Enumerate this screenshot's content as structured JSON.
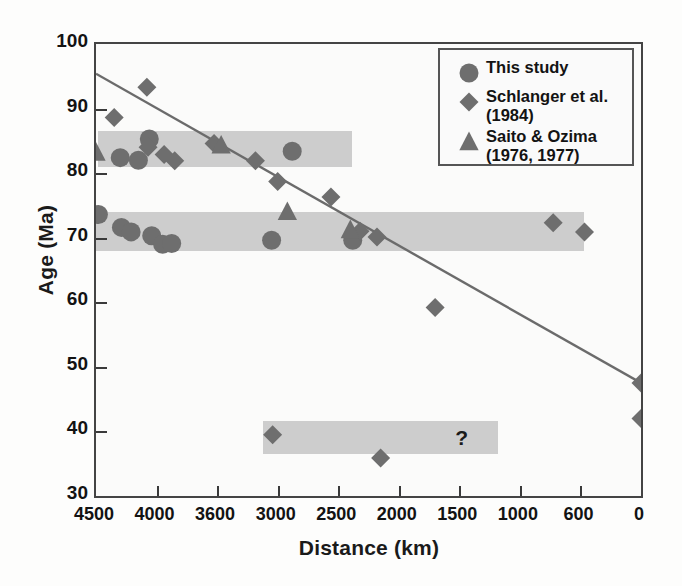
{
  "chart_data": {
    "type": "scatter",
    "title": "",
    "xlabel": "Distance (km)",
    "ylabel": "Age (Ma)",
    "grid": false,
    "legend_position": "top-right",
    "ylim": [
      30,
      100
    ],
    "yticks": [
      100,
      90,
      80,
      70,
      60,
      50,
      40,
      30
    ],
    "xticks_labels": [
      "4500",
      "4000",
      "3600",
      "3000",
      "2500",
      "2000",
      "1500",
      "1000",
      "600",
      "0"
    ],
    "xaxis_note": "ordinal: ticks evenly spaced, values decrease left to right",
    "legend": [
      {
        "label_lines": [
          "This study"
        ],
        "marker": "circle"
      },
      {
        "label_lines": [
          "Schlanger et al.",
          "(1984)"
        ],
        "marker": "diamond"
      },
      {
        "label_lines": [
          "Saito & Ozima",
          "(1976, 1977)"
        ],
        "marker": "triangle"
      }
    ],
    "series": [
      {
        "name": "This study",
        "marker": "circle",
        "points": [
          {
            "x": 4480,
            "y": 73.6
          },
          {
            "x": 4300,
            "y": 82.4
          },
          {
            "x": 4290,
            "y": 71.6
          },
          {
            "x": 4210,
            "y": 70.9
          },
          {
            "x": 4150,
            "y": 82.0
          },
          {
            "x": 4060,
            "y": 85.3
          },
          {
            "x": 4040,
            "y": 70.3
          },
          {
            "x": 3960,
            "y": 69.0
          },
          {
            "x": 3900,
            "y": 69.1
          },
          {
            "x": 3060,
            "y": 69.6
          },
          {
            "x": 2880,
            "y": 83.4
          },
          {
            "x": 2380,
            "y": 69.6
          }
        ]
      },
      {
        "name": "Schlanger et al. (1984)",
        "marker": "diamond",
        "points": [
          {
            "x": 4350,
            "y": 88.6
          },
          {
            "x": 4080,
            "y": 93.3
          },
          {
            "x": 4070,
            "y": 84.0
          },
          {
            "x": 3950,
            "y": 82.9
          },
          {
            "x": 3880,
            "y": 81.9
          },
          {
            "x": 3620,
            "y": 84.6
          },
          {
            "x": 3220,
            "y": 81.9
          },
          {
            "x": 3000,
            "y": 78.7
          },
          {
            "x": 2560,
            "y": 76.3
          },
          {
            "x": 2320,
            "y": 71.0
          },
          {
            "x": 2180,
            "y": 70.1
          },
          {
            "x": 1700,
            "y": 59.2
          },
          {
            "x": 780,
            "y": 72.3
          },
          {
            "x": 560,
            "y": 70.9
          },
          {
            "x": 3050,
            "y": 39.5
          },
          {
            "x": 2150,
            "y": 35.9
          },
          {
            "x": 0,
            "y": 47.5
          },
          {
            "x": 0,
            "y": 42.0
          }
        ]
      },
      {
        "name": "Saito & Ozima (1976, 1977)",
        "marker": "triangle",
        "points": [
          {
            "x": 4500,
            "y": 83.2
          },
          {
            "x": 3560,
            "y": 84.3
          },
          {
            "x": 2920,
            "y": 74.0
          },
          {
            "x": 2400,
            "y": 71.2
          }
        ]
      }
    ],
    "trend_line": {
      "x_start": 4500,
      "y_start": 95.4,
      "x_end": 0,
      "y_end": 47.5
    },
    "shaded_bands": [
      {
        "name": "upper-age-band",
        "x_from": 4480,
        "x_to": 2390,
        "y_from": 81.0,
        "y_to": 86.6
      },
      {
        "name": "middle-age-band",
        "x_from": 4500,
        "x_to": 560,
        "y_from": 68.0,
        "y_to": 74.0
      },
      {
        "name": "lower-age-band",
        "x_from": 3150,
        "x_to": 1180,
        "y_from": 36.5,
        "y_to": 41.6,
        "annotation": "?"
      }
    ],
    "annotations": [
      {
        "text": "?",
        "x": 1480,
        "y": 39.0
      }
    ],
    "colors": {
      "marker": "#6e6e6e",
      "marker_dark": "#5a5a5a",
      "band": "#c9c9c9",
      "trend_line": "#6b6b6b",
      "axis": "#444444",
      "text": "#131313",
      "background": "#fbfbfa"
    }
  }
}
